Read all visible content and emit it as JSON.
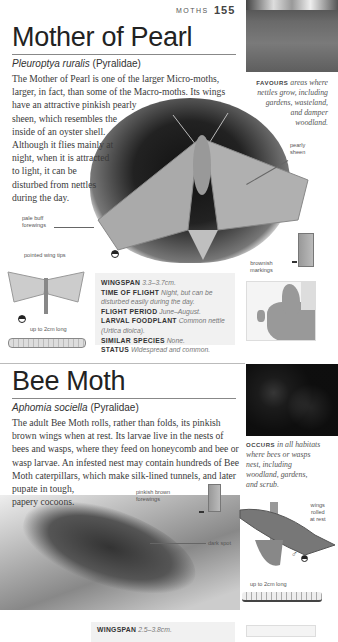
{
  "header": {
    "section": "MOTHS",
    "page_number": "155"
  },
  "species": [
    {
      "name": "Mother of Pearl",
      "scientific_name": "Pleuroptya ruralis",
      "family": "(Pyralidae)",
      "description": "The Mother of Pearl is one of the larger Micro-moths, larger, in fact, than some of the Macro-moths. Its wings have an attractive pinkish pearly sheen, which resembles the inside of an oyster shell. Although it flies mainly at night, when it is attracted to light, it can be disturbed from nettles during the day.",
      "desc_lines": [
        "The Mother of Pearl is one of the larger Micro-moths,",
        "larger, in fact, than some of the Macro-moths. Its wings",
        "have an attractive pinkish pearly",
        "sheen, which resembles the",
        "inside of an oyster shell.",
        "Although it flies mainly at",
        "night, when it is attracted",
        "to light, it can be",
        "disturbed from nettles",
        "during the day."
      ],
      "habitat": {
        "key": "FAVOURS",
        "lines": [
          "areas where",
          "nettles grow, including",
          "gardens, wasteland,",
          "and damper",
          "woodland."
        ]
      },
      "annotations": {
        "pearly_sheen": [
          "pearly",
          "sheen"
        ],
        "pale_buff": [
          "pale buff",
          "forewings"
        ],
        "pointed_tips": "pointed wing tips",
        "brownish": [
          "brownish",
          "markings"
        ],
        "larva_size": "up to 2cm long"
      },
      "facts": [
        {
          "key": "WINGSPAN",
          "value": "3.3–3.7cm."
        },
        {
          "key": "TIME OF FLIGHT",
          "value": "Night, but can be disturbed easily during the day."
        },
        {
          "key": "FLIGHT PERIOD",
          "value": "June–August."
        },
        {
          "key": "LARVAL FOODPLANT",
          "value": "Common nettle (Urtica dioica)."
        },
        {
          "key": "SIMILAR SPECIES",
          "value": "None."
        },
        {
          "key": "STATUS",
          "value": "Widespread and common."
        }
      ]
    },
    {
      "name": "Bee Moth",
      "scientific_name": "Aphomia sociella",
      "family": "(Pyralidae)",
      "desc_lines": [
        "The adult Bee Moth rolls, rather than folds, its pinkish",
        "brown wings when at rest. Its larvae live in the nests of",
        "bees and wasps, where they feed on honeycomb and bee or",
        "wasp larvae. An infested nest may contain hundreds of Bee",
        "Moth caterpillars, which make silk-lined tunnels, and later",
        "pupate in tough,",
        "papery cocoons."
      ],
      "habitat": {
        "key": "OCCURS",
        "lines": [
          "in all habitats",
          "where bees or wasps",
          "nest, including",
          "woodland, gardens,",
          "and scrub."
        ]
      },
      "annotations": {
        "pinkish_brown": [
          "pinkish brown",
          "forewings"
        ],
        "dark_spot": "dark spot",
        "wings_rolled": [
          "wings",
          "rolled",
          "at rest"
        ],
        "sex_symbol": "♂",
        "larva_size": "up to 2cm long"
      },
      "facts": [
        {
          "key": "WINGSPAN",
          "value": "2.5–3.8cm."
        }
      ]
    }
  ]
}
